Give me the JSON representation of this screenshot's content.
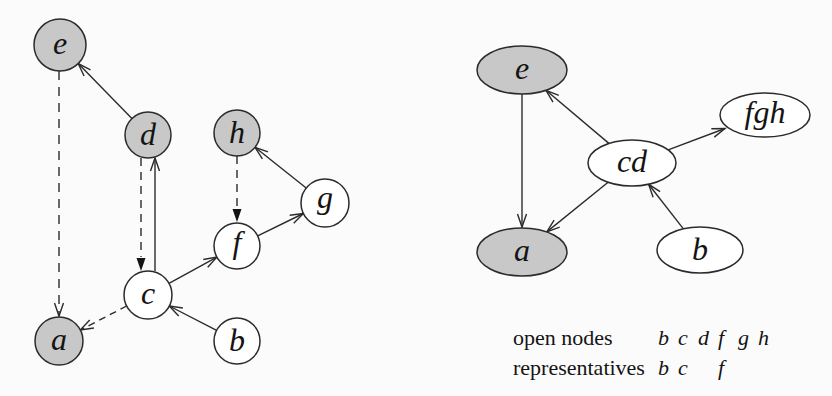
{
  "figure": {
    "background": "#fbfbfb",
    "colors": {
      "shaded_fill": "#c8c8c8",
      "open_fill": "#ffffff",
      "stroke": "#2b2b2b",
      "text": "#141414"
    }
  },
  "left_graph": {
    "nodes": [
      {
        "id": "e",
        "label": "e",
        "shaded": true
      },
      {
        "id": "d",
        "label": "d",
        "shaded": true
      },
      {
        "id": "h",
        "label": "h",
        "shaded": true
      },
      {
        "id": "g",
        "label": "g",
        "shaded": false
      },
      {
        "id": "f",
        "label": "f",
        "shaded": false
      },
      {
        "id": "c",
        "label": "c",
        "shaded": false
      },
      {
        "id": "b",
        "label": "b",
        "shaded": false
      },
      {
        "id": "a",
        "label": "a",
        "shaded": true
      }
    ],
    "edges": [
      {
        "from": "d",
        "to": "e",
        "line": "solid",
        "head": "open"
      },
      {
        "from": "e",
        "to": "a",
        "line": "dashed",
        "head": "open"
      },
      {
        "from": "d",
        "to": "c",
        "line": "dashed",
        "head": "filled-triangle"
      },
      {
        "from": "c",
        "to": "d",
        "line": "solid",
        "head": "open"
      },
      {
        "from": "h",
        "to": "f",
        "line": "dashed",
        "head": "filled-triangle"
      },
      {
        "from": "g",
        "to": "h",
        "line": "solid",
        "head": "open"
      },
      {
        "from": "f",
        "to": "g",
        "line": "solid",
        "head": "open"
      },
      {
        "from": "c",
        "to": "f",
        "line": "solid",
        "head": "open"
      },
      {
        "from": "b",
        "to": "c",
        "line": "solid",
        "head": "open"
      },
      {
        "from": "c",
        "to": "a",
        "line": "dashed",
        "head": "open"
      }
    ]
  },
  "right_graph": {
    "nodes": [
      {
        "id": "e",
        "label": "e",
        "shaded": true
      },
      {
        "id": "fgh",
        "label": "fgh",
        "shaded": false
      },
      {
        "id": "cd",
        "label": "cd",
        "shaded": false
      },
      {
        "id": "a",
        "label": "a",
        "shaded": true
      },
      {
        "id": "b",
        "label": "b",
        "shaded": false
      }
    ],
    "edges": [
      {
        "from": "e",
        "to": "a",
        "line": "solid",
        "head": "open"
      },
      {
        "from": "cd",
        "to": "e",
        "line": "solid",
        "head": "open"
      },
      {
        "from": "cd",
        "to": "fgh",
        "line": "solid",
        "head": "open"
      },
      {
        "from": "cd",
        "to": "a",
        "line": "solid",
        "head": "open"
      },
      {
        "from": "b",
        "to": "cd",
        "line": "solid",
        "head": "open"
      }
    ]
  },
  "legend": {
    "rows": [
      {
        "label": "open nodes",
        "values": [
          "b",
          "c",
          "d",
          "f",
          "g",
          "h"
        ]
      },
      {
        "label": "representatives",
        "values": [
          "b",
          "c",
          "",
          "f",
          "",
          ""
        ]
      }
    ]
  }
}
